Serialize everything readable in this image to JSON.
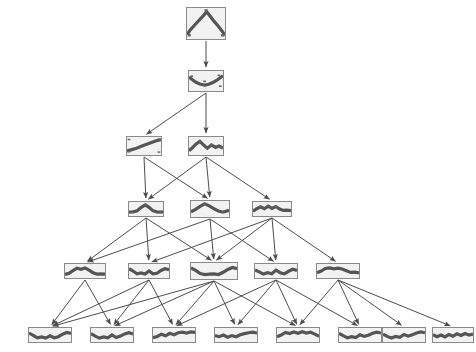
{
  "diagram": {
    "type": "directed-acyclic-graph",
    "width": 476,
    "height": 352,
    "background_color": "#ffffff",
    "node_border_color": "#8a8a8a",
    "node_fill_color": "#f2f2f2",
    "plot_line_color": "#555555",
    "edge_color": "#4d4d4d",
    "levels": 6
  },
  "nodes": [
    {
      "id": "n0",
      "label": "root-node",
      "level": 0,
      "x": 186,
      "y": 7,
      "w": 40,
      "h": 33,
      "plot_type": "line",
      "plot": {
        "x": [
          0,
          8,
          18,
          30,
          42,
          52,
          62,
          72,
          82,
          92,
          100
        ],
        "y": [
          86,
          72,
          58,
          42,
          26,
          12,
          28,
          44,
          58,
          74,
          88
        ],
        "markers": [
          {
            "x": 6,
            "y": 88
          },
          {
            "x": 94,
            "y": 88
          },
          {
            "x": 50,
            "y": 8
          }
        ]
      }
    },
    {
      "id": "n1",
      "label": "level1-node-1",
      "level": 1,
      "x": 188,
      "y": 70,
      "w": 36,
      "h": 22,
      "plot_type": "line",
      "plot": {
        "x": [
          0,
          10,
          22,
          34,
          46,
          58,
          70,
          82,
          92,
          100
        ],
        "y": [
          30,
          44,
          58,
          66,
          70,
          66,
          58,
          46,
          34,
          24
        ],
        "markers": [
          {
            "x": 8,
            "y": 26
          },
          {
            "x": 46,
            "y": 52
          },
          {
            "x": 88,
            "y": 22
          },
          {
            "x": 92,
            "y": 76
          }
        ]
      }
    },
    {
      "id": "n2",
      "label": "level2-node-1",
      "level": 2,
      "x": 126,
      "y": 136,
      "w": 36,
      "h": 20,
      "plot_type": "line",
      "plot": {
        "x": [
          0,
          14,
          28,
          42,
          56,
          70,
          84,
          100
        ],
        "y": [
          78,
          70,
          62,
          52,
          42,
          32,
          22,
          14
        ],
        "markers": [
          {
            "x": 6,
            "y": 82
          },
          {
            "x": 94,
            "y": 12
          },
          {
            "x": 6,
            "y": 14
          },
          {
            "x": 94,
            "y": 84
          }
        ]
      }
    },
    {
      "id": "n3",
      "label": "level2-node-2",
      "level": 2,
      "x": 188,
      "y": 136,
      "w": 36,
      "h": 20,
      "plot_type": "line",
      "plot": {
        "x": [
          0,
          10,
          20,
          32,
          44,
          54,
          66,
          78,
          88,
          100
        ],
        "y": [
          76,
          60,
          40,
          24,
          46,
          62,
          44,
          58,
          50,
          62
        ],
        "markers": [
          {
            "x": 32,
            "y": 24
          },
          {
            "x": 66,
            "y": 44
          },
          {
            "x": 94,
            "y": 60
          }
        ]
      }
    },
    {
      "id": "n4",
      "label": "level3-node-1",
      "level": 3,
      "x": 128,
      "y": 201,
      "w": 36,
      "h": 16,
      "plot_type": "line",
      "plot": {
        "x": [
          0,
          12,
          24,
          36,
          48,
          58,
          70,
          82,
          92,
          100
        ],
        "y": [
          72,
          70,
          62,
          38,
          20,
          36,
          62,
          70,
          72,
          70
        ],
        "markers": [
          {
            "x": 48,
            "y": 20
          },
          {
            "x": 8,
            "y": 74
          },
          {
            "x": 92,
            "y": 74
          }
        ]
      }
    },
    {
      "id": "n5",
      "label": "level3-node-2",
      "level": 3,
      "x": 190,
      "y": 200,
      "w": 40,
      "h": 18,
      "plot_type": "line",
      "plot": {
        "x": [
          0,
          12,
          24,
          36,
          48,
          60,
          72,
          84,
          100
        ],
        "y": [
          68,
          52,
          34,
          18,
          30,
          48,
          62,
          70,
          58
        ],
        "markers": [
          {
            "x": 36,
            "y": 18
          },
          {
            "x": 84,
            "y": 70
          }
        ]
      }
    },
    {
      "id": "n6",
      "label": "level3-node-3",
      "level": 3,
      "x": 252,
      "y": 201,
      "w": 40,
      "h": 16,
      "plot_type": "line",
      "plot": {
        "x": [
          0,
          10,
          20,
          30,
          40,
          50,
          60,
          70,
          80,
          90,
          100
        ],
        "y": [
          66,
          48,
          34,
          48,
          30,
          46,
          32,
          50,
          60,
          58,
          62
        ],
        "markers": [
          {
            "x": 20,
            "y": 34
          },
          {
            "x": 40,
            "y": 30
          },
          {
            "x": 60,
            "y": 32
          }
        ]
      }
    },
    {
      "id": "n7",
      "label": "level4-node-1",
      "level": 4,
      "x": 64,
      "y": 263,
      "w": 42,
      "h": 16,
      "plot_type": "line",
      "plot": {
        "x": [
          0,
          10,
          20,
          30,
          40,
          50,
          60,
          70,
          80,
          90,
          100
        ],
        "y": [
          74,
          66,
          48,
          30,
          38,
          28,
          44,
          62,
          72,
          70,
          72
        ]
      }
    },
    {
      "id": "n8",
      "label": "level4-node-2",
      "level": 4,
      "x": 128,
      "y": 263,
      "w": 42,
      "h": 16,
      "plot_type": "line",
      "plot": {
        "x": [
          0,
          10,
          20,
          30,
          40,
          50,
          60,
          70,
          80,
          90,
          100
        ],
        "y": [
          34,
          50,
          70,
          64,
          72,
          50,
          70,
          66,
          46,
          34,
          40
        ]
      }
    },
    {
      "id": "n9",
      "label": "level4-node-3",
      "level": 4,
      "x": 190,
      "y": 262,
      "w": 48,
      "h": 18,
      "plot_type": "line",
      "plot": {
        "x": [
          0,
          10,
          20,
          30,
          40,
          50,
          60,
          70,
          80,
          90,
          100
        ],
        "y": [
          30,
          46,
          66,
          72,
          70,
          68,
          72,
          58,
          40,
          28,
          36
        ]
      }
    },
    {
      "id": "n10",
      "label": "level4-node-4",
      "level": 4,
      "x": 254,
      "y": 263,
      "w": 44,
      "h": 16,
      "plot_type": "line",
      "plot": {
        "x": [
          0,
          10,
          20,
          30,
          40,
          50,
          60,
          70,
          80,
          90,
          100
        ],
        "y": [
          42,
          56,
          72,
          62,
          70,
          44,
          62,
          70,
          52,
          38,
          46
        ]
      }
    },
    {
      "id": "n11",
      "label": "level4-node-5",
      "level": 4,
      "x": 316,
      "y": 263,
      "w": 44,
      "h": 16,
      "plot_type": "line",
      "plot": {
        "x": [
          0,
          10,
          20,
          30,
          40,
          50,
          60,
          70,
          80,
          90,
          100
        ],
        "y": [
          62,
          50,
          32,
          28,
          34,
          30,
          36,
          48,
          60,
          58,
          64
        ]
      }
    },
    {
      "id": "n12",
      "label": "level5-node-1",
      "level": 5,
      "x": 28,
      "y": 327,
      "w": 44,
      "h": 16,
      "plot_type": "line",
      "plot": {
        "x": [
          0,
          10,
          20,
          30,
          40,
          50,
          60,
          70,
          80,
          90,
          100
        ],
        "y": [
          36,
          52,
          70,
          64,
          72,
          56,
          70,
          62,
          44,
          32,
          38
        ]
      }
    },
    {
      "id": "n13",
      "label": "level5-node-2",
      "level": 5,
      "x": 90,
      "y": 327,
      "w": 44,
      "h": 16,
      "plot_type": "line",
      "plot": {
        "x": [
          0,
          10,
          20,
          30,
          40,
          50,
          60,
          70,
          80,
          90,
          100
        ],
        "y": [
          40,
          58,
          72,
          64,
          70,
          50,
          68,
          58,
          42,
          34,
          42
        ]
      }
    },
    {
      "id": "n14",
      "label": "level5-node-3",
      "level": 5,
      "x": 152,
      "y": 327,
      "w": 44,
      "h": 16,
      "plot_type": "line",
      "plot": {
        "x": [
          0,
          10,
          20,
          30,
          40,
          50,
          60,
          70,
          80,
          90,
          100
        ],
        "y": [
          70,
          60,
          44,
          56,
          38,
          48,
          34,
          30,
          36,
          28,
          32
        ]
      }
    },
    {
      "id": "n15",
      "label": "level5-node-4",
      "level": 5,
      "x": 214,
      "y": 327,
      "w": 44,
      "h": 16,
      "plot_type": "line",
      "plot": {
        "x": [
          0,
          10,
          20,
          30,
          40,
          50,
          60,
          70,
          80,
          90,
          100
        ],
        "y": [
          54,
          62,
          50,
          66,
          54,
          62,
          48,
          40,
          34,
          30,
          36
        ]
      }
    },
    {
      "id": "n16",
      "label": "level5-node-5",
      "level": 5,
      "x": 276,
      "y": 327,
      "w": 44,
      "h": 16,
      "plot_type": "line",
      "plot": {
        "x": [
          0,
          10,
          20,
          30,
          40,
          50,
          60,
          70,
          80,
          90,
          100
        ],
        "y": [
          62,
          50,
          32,
          40,
          28,
          38,
          26,
          36,
          30,
          44,
          60
        ]
      }
    },
    {
      "id": "n17",
      "label": "level5-node-6",
      "level": 5,
      "x": 338,
      "y": 327,
      "w": 44,
      "h": 16,
      "plot_type": "line",
      "plot": {
        "x": [
          0,
          10,
          20,
          30,
          40,
          50,
          60,
          70,
          80,
          90,
          100
        ],
        "y": [
          38,
          54,
          70,
          62,
          68,
          48,
          60,
          52,
          38,
          30,
          36
        ]
      }
    },
    {
      "id": "n18",
      "label": "level5-node-7",
      "level": 5,
      "x": 382,
      "y": 327,
      "w": 44,
      "h": 16,
      "plot_type": "line",
      "plot": {
        "x": [
          0,
          10,
          20,
          30,
          40,
          50,
          60,
          70,
          80,
          90,
          100
        ],
        "y": [
          44,
          60,
          72,
          60,
          66,
          46,
          58,
          48,
          36,
          28,
          34
        ]
      }
    },
    {
      "id": "n19",
      "label": "level5-node-8",
      "level": 5,
      "x": 432,
      "y": 327,
      "w": 42,
      "h": 16,
      "plot_type": "line",
      "plot": {
        "x": [
          0,
          10,
          20,
          30,
          40,
          50,
          60,
          70,
          80,
          90,
          100
        ],
        "y": [
          48,
          62,
          50,
          64,
          46,
          58,
          42,
          54,
          40,
          50,
          44
        ]
      }
    }
  ],
  "edges": [
    {
      "from": "n0",
      "to": "n1"
    },
    {
      "from": "n1",
      "to": "n2"
    },
    {
      "from": "n1",
      "to": "n3"
    },
    {
      "from": "n2",
      "to": "n4"
    },
    {
      "from": "n2",
      "to": "n5"
    },
    {
      "from": "n3",
      "to": "n4"
    },
    {
      "from": "n3",
      "to": "n5"
    },
    {
      "from": "n3",
      "to": "n6"
    },
    {
      "from": "n4",
      "to": "n7"
    },
    {
      "from": "n4",
      "to": "n8"
    },
    {
      "from": "n4",
      "to": "n9"
    },
    {
      "from": "n5",
      "to": "n7"
    },
    {
      "from": "n5",
      "to": "n9"
    },
    {
      "from": "n5",
      "to": "n10"
    },
    {
      "from": "n6",
      "to": "n8"
    },
    {
      "from": "n6",
      "to": "n9"
    },
    {
      "from": "n6",
      "to": "n10"
    },
    {
      "from": "n6",
      "to": "n11"
    },
    {
      "from": "n7",
      "to": "n12"
    },
    {
      "from": "n7",
      "to": "n13"
    },
    {
      "from": "n8",
      "to": "n12"
    },
    {
      "from": "n8",
      "to": "n13"
    },
    {
      "from": "n8",
      "to": "n14"
    },
    {
      "from": "n9",
      "to": "n12"
    },
    {
      "from": "n9",
      "to": "n13"
    },
    {
      "from": "n9",
      "to": "n14"
    },
    {
      "from": "n9",
      "to": "n15"
    },
    {
      "from": "n9",
      "to": "n16"
    },
    {
      "from": "n10",
      "to": "n14"
    },
    {
      "from": "n10",
      "to": "n15"
    },
    {
      "from": "n10",
      "to": "n16"
    },
    {
      "from": "n10",
      "to": "n17"
    },
    {
      "from": "n11",
      "to": "n16"
    },
    {
      "from": "n11",
      "to": "n17"
    },
    {
      "from": "n11",
      "to": "n18"
    },
    {
      "from": "n11",
      "to": "n19"
    }
  ]
}
